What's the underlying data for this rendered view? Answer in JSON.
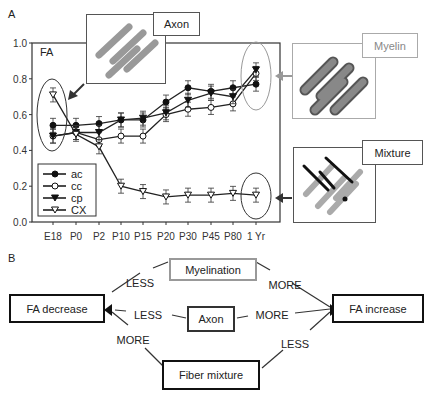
{
  "panels": {
    "a_label": "A",
    "b_label": "B"
  },
  "insets": {
    "axon": {
      "label": "Axon",
      "color": "#333333"
    },
    "myelin": {
      "label": "Myelin",
      "color": "#999999"
    },
    "mixture": {
      "label": "Mixture",
      "color": "#333333"
    }
  },
  "chart_data": {
    "type": "line",
    "title": "FA",
    "xlabel": "",
    "ylabel": "FA",
    "ylim": [
      0.0,
      1.0
    ],
    "yticks": [
      "0.0",
      "0.2",
      "0.4",
      "0.6",
      "0.8",
      "1.0"
    ],
    "categories": [
      "E18",
      "P0",
      "P2",
      "P10",
      "P15",
      "P20",
      "P30",
      "P45",
      "P80",
      "1 Yr"
    ],
    "series": [
      {
        "name": "ac",
        "marker": "filled-circle",
        "values": [
          0.54,
          0.54,
          0.55,
          0.57,
          0.57,
          0.67,
          0.75,
          0.73,
          0.75,
          0.77
        ]
      },
      {
        "name": "cc",
        "marker": "open-circle",
        "values": [
          0.48,
          0.5,
          0.46,
          0.48,
          0.48,
          0.6,
          0.63,
          0.64,
          0.66,
          0.83
        ]
      },
      {
        "name": "cp",
        "marker": "filled-triangle",
        "values": [
          0.48,
          0.5,
          0.5,
          0.57,
          0.58,
          0.61,
          0.68,
          0.72,
          0.7,
          0.85
        ]
      },
      {
        "name": "CX",
        "marker": "open-triangle",
        "values": [
          0.71,
          0.49,
          0.42,
          0.2,
          0.17,
          0.14,
          0.15,
          0.15,
          0.16,
          0.15
        ]
      }
    ],
    "legend_position": "lower-left",
    "grid": false
  },
  "diagram": {
    "nodes": {
      "fa_decrease": "FA decrease",
      "fa_increase": "FA increase",
      "myelination": "Myelination",
      "axon": "Axon",
      "fiber_mixture": "Fiber mixture"
    },
    "edges": {
      "myelination_left": "LESS",
      "myelination_right": "MORE",
      "axon_left": "LESS",
      "axon_right": "MORE",
      "mixture_left": "MORE",
      "mixture_right": "LESS"
    }
  }
}
